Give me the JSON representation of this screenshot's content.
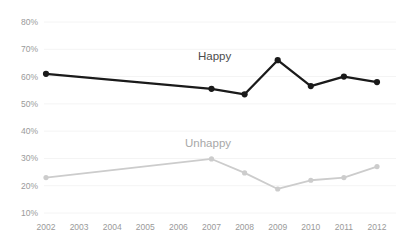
{
  "chart_data": {
    "type": "line",
    "title": "",
    "subtitle": "",
    "xlabel": "",
    "ylabel": "",
    "categories": [
      "2002",
      "2003",
      "2004",
      "2005",
      "2006",
      "2007",
      "2008",
      "2009",
      "2010",
      "2011",
      "2012"
    ],
    "x_tick_labels": [
      "2002",
      "2003",
      "2004",
      "2005",
      "2006",
      "2007",
      "2008",
      "2009",
      "2010",
      "2011",
      "2012"
    ],
    "y_tick_labels": [
      "80%",
      "70%",
      "60%",
      "50%",
      "40%",
      "30%",
      "20%",
      "10%"
    ],
    "y_tick_values": [
      80,
      70,
      60,
      50,
      40,
      30,
      20,
      10
    ],
    "ylim": [
      10,
      80
    ],
    "grid": true,
    "grid_axis": "y",
    "legend_position": "inline-above-series",
    "series": [
      {
        "name": "Happy",
        "label": "Happy",
        "color": "#1a1a1a",
        "marker": "circle",
        "marker_years": [
          "2002",
          "2007",
          "2008",
          "2009",
          "2010",
          "2011",
          "2012"
        ],
        "values": [
          61,
          null,
          null,
          null,
          null,
          55.5,
          53.5,
          66,
          56.5,
          60,
          58
        ]
      },
      {
        "name": "Unhappy",
        "label": "Unhappy",
        "color": "#cccccc",
        "marker": "circle",
        "marker_years": [
          "2002",
          "2007",
          "2008",
          "2009",
          "2010",
          "2011",
          "2012"
        ],
        "values": [
          23,
          null,
          null,
          null,
          null,
          29.8,
          24.7,
          18.8,
          22,
          23,
          27
        ]
      }
    ],
    "annotations": [
      {
        "text": "Happy",
        "series": "Happy"
      },
      {
        "text": "Unhappy",
        "series": "Unhappy"
      }
    ]
  },
  "axis": {
    "y_labels": [
      "80%",
      "70%",
      "60%",
      "50%",
      "40%",
      "30%",
      "20%",
      "10%"
    ],
    "x_labels": [
      "2002",
      "2003",
      "2004",
      "2005",
      "2006",
      "2007",
      "2008",
      "2009",
      "2010",
      "2011",
      "2012"
    ]
  },
  "labels": {
    "happy": "Happy",
    "unhappy": "Unhappy"
  },
  "colors": {
    "happy_line": "#1a1a1a",
    "unhappy_line": "#cccccc",
    "gridline": "#f4f4f4",
    "tick_text": "#9a9a9a",
    "happy_text": "#4c4c4c",
    "unhappy_text": "#a8a8a8",
    "background": "#ffffff"
  }
}
